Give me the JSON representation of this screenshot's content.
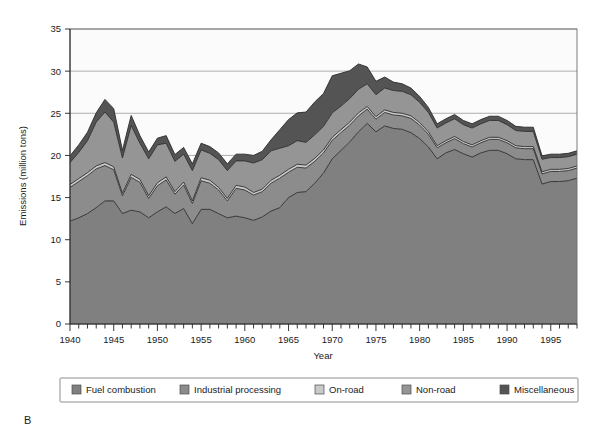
{
  "panel_letter": "B",
  "axes": {
    "x_title": "Year",
    "y_title": "Emissions (million tons)",
    "y_ticks": [
      "0",
      "5",
      "10",
      "15",
      "20",
      "25",
      "30",
      "35"
    ],
    "x_ticks": [
      "1940",
      "1945",
      "1950",
      "1955",
      "1960",
      "1965",
      "1970",
      "1975",
      "1980",
      "1985",
      "1990",
      "1995"
    ]
  },
  "legend": {
    "items": [
      {
        "label": "Fuel combustion",
        "color": "#808080"
      },
      {
        "label": "Industrial processing",
        "color": "#8c8c8c"
      },
      {
        "label": "On-road",
        "color": "#c9c9c9"
      },
      {
        "label": "Non-road",
        "color": "#959595"
      },
      {
        "label": "Miscellaneous",
        "color": "#545454"
      }
    ]
  },
  "chart_data": {
    "type": "area",
    "stacked": true,
    "title": "",
    "xlabel": "Year",
    "ylabel": "Emissions (million tons)",
    "xlim": [
      1940,
      1998
    ],
    "ylim": [
      0,
      35
    ],
    "grid": true,
    "legend_position": "bottom",
    "x": [
      1940,
      1941,
      1942,
      1943,
      1944,
      1945,
      1946,
      1947,
      1948,
      1949,
      1950,
      1951,
      1952,
      1953,
      1954,
      1955,
      1956,
      1957,
      1958,
      1959,
      1960,
      1961,
      1962,
      1963,
      1964,
      1965,
      1966,
      1967,
      1968,
      1969,
      1970,
      1971,
      1972,
      1973,
      1974,
      1975,
      1976,
      1977,
      1978,
      1979,
      1980,
      1981,
      1982,
      1983,
      1984,
      1985,
      1986,
      1987,
      1988,
      1989,
      1990,
      1991,
      1992,
      1993,
      1994,
      1995,
      1996,
      1997,
      1998
    ],
    "series": [
      {
        "name": "Fuel combustion",
        "color": "#808080",
        "values": [
          12.2,
          12.6,
          13.1,
          13.8,
          14.6,
          14.6,
          13.1,
          13.5,
          13.3,
          12.6,
          13.3,
          13.9,
          13.1,
          13.7,
          11.9,
          13.6,
          13.6,
          13.1,
          12.6,
          12.8,
          12.6,
          12.3,
          12.7,
          13.4,
          13.8,
          15.0,
          15.6,
          15.7,
          16.7,
          17.9,
          19.6,
          20.6,
          21.6,
          22.8,
          23.8,
          22.8,
          23.5,
          23.2,
          23.1,
          22.7,
          22.0,
          21.0,
          19.6,
          20.3,
          20.7,
          20.2,
          19.8,
          20.3,
          20.6,
          20.6,
          20.2,
          19.6,
          19.5,
          19.5,
          16.6,
          16.9,
          16.9,
          17.0,
          17.3
        ]
      },
      {
        "name": "Industrial processing",
        "color": "#8c8c8c",
        "values": [
          4.0,
          4.3,
          4.5,
          4.6,
          4.2,
          3.7,
          2.1,
          3.9,
          3.5,
          2.3,
          3.1,
          3.2,
          2.3,
          2.8,
          2.4,
          3.4,
          3.1,
          2.8,
          2.0,
          3.3,
          3.3,
          3.0,
          3.0,
          3.3,
          3.5,
          3.0,
          3.0,
          2.8,
          2.6,
          2.4,
          2.2,
          2.1,
          2.0,
          1.9,
          1.7,
          1.5,
          1.6,
          1.6,
          1.6,
          1.7,
          1.6,
          1.5,
          1.3,
          1.2,
          1.3,
          1.2,
          1.2,
          1.2,
          1.3,
          1.3,
          1.3,
          1.3,
          1.3,
          1.3,
          1.2,
          1.2,
          1.2,
          1.2,
          1.2
        ]
      },
      {
        "name": "On-road",
        "color": "#c9c9c9",
        "values": [
          0.35,
          0.35,
          0.35,
          0.35,
          0.35,
          0.35,
          0.3,
          0.35,
          0.35,
          0.3,
          0.35,
          0.35,
          0.3,
          0.35,
          0.3,
          0.35,
          0.35,
          0.3,
          0.3,
          0.35,
          0.35,
          0.3,
          0.3,
          0.35,
          0.35,
          0.35,
          0.35,
          0.35,
          0.35,
          0.35,
          0.35,
          0.35,
          0.35,
          0.35,
          0.3,
          0.3,
          0.3,
          0.3,
          0.3,
          0.3,
          0.3,
          0.3,
          0.25,
          0.25,
          0.25,
          0.25,
          0.25,
          0.25,
          0.25,
          0.25,
          0.25,
          0.25,
          0.25,
          0.25,
          0.25,
          0.25,
          0.25,
          0.25,
          0.25
        ]
      },
      {
        "name": "Non-road",
        "color": "#959595",
        "values": [
          2.6,
          3.1,
          3.8,
          5.2,
          6.0,
          5.3,
          4.2,
          5.8,
          4.3,
          4.4,
          4.5,
          4.0,
          3.6,
          3.3,
          3.6,
          3.3,
          3.2,
          3.3,
          3.3,
          2.9,
          3.1,
          3.5,
          3.5,
          3.5,
          3.2,
          2.8,
          2.8,
          2.7,
          2.8,
          2.8,
          2.9,
          2.8,
          2.8,
          2.8,
          2.7,
          2.6,
          2.6,
          2.6,
          2.6,
          2.5,
          2.4,
          2.3,
          2.1,
          2.1,
          2.1,
          2.0,
          2.0,
          2.0,
          2.0,
          2.0,
          1.9,
          1.8,
          1.8,
          1.8,
          1.5,
          1.4,
          1.4,
          1.4,
          1.4
        ]
      },
      {
        "name": "Miscellaneous",
        "color": "#545454",
        "values": [
          0.8,
          0.9,
          1.0,
          1.1,
          1.5,
          1.6,
          0.9,
          1.2,
          0.9,
          0.8,
          0.8,
          0.9,
          0.8,
          0.8,
          0.8,
          0.8,
          0.8,
          0.8,
          0.8,
          0.8,
          0.8,
          0.9,
          1.0,
          1.3,
          2.2,
          3.1,
          3.3,
          3.6,
          3.9,
          3.9,
          4.4,
          3.9,
          3.3,
          3.0,
          2.0,
          1.6,
          1.3,
          1.0,
          0.9,
          0.8,
          0.7,
          0.6,
          0.5,
          0.5,
          0.5,
          0.5,
          0.5,
          0.5,
          0.5,
          0.5,
          0.5,
          0.5,
          0.5,
          0.5,
          0.4,
          0.4,
          0.4,
          0.4,
          0.4
        ]
      }
    ]
  }
}
